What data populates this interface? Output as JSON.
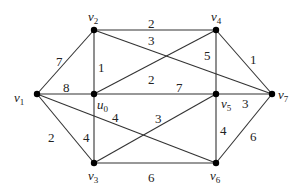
{
  "graph": {
    "type": "weighted-undirected",
    "nodes": [
      {
        "id": "v1",
        "label": "v",
        "sub": "1",
        "x": 37,
        "y": 94,
        "lx": 14,
        "ly": 102
      },
      {
        "id": "v2",
        "label": "v",
        "sub": "2",
        "x": 94,
        "y": 30,
        "lx": 88,
        "ly": 21
      },
      {
        "id": "u0",
        "label": "u",
        "sub": "0",
        "x": 94,
        "y": 94,
        "lx": 97,
        "ly": 109
      },
      {
        "id": "v4",
        "label": "v",
        "sub": "4",
        "x": 216,
        "y": 30,
        "lx": 211,
        "ly": 21
      },
      {
        "id": "v5",
        "label": "v",
        "sub": "5",
        "x": 216,
        "y": 94,
        "lx": 221,
        "ly": 108
      },
      {
        "id": "v7",
        "label": "v",
        "sub": "7",
        "x": 272,
        "y": 94,
        "lx": 278,
        "ly": 99
      },
      {
        "id": "v3",
        "label": "v",
        "sub": "3",
        "x": 94,
        "y": 163,
        "lx": 88,
        "ly": 180
      },
      {
        "id": "v6",
        "label": "v",
        "sub": "6",
        "x": 216,
        "y": 163,
        "lx": 210,
        "ly": 180
      }
    ],
    "edges": [
      {
        "from": "v1",
        "to": "v2",
        "weight": "7",
        "lx": 56,
        "ly": 66
      },
      {
        "from": "v1",
        "to": "u0",
        "weight": "8",
        "lx": 63,
        "ly": 92
      },
      {
        "from": "v1",
        "to": "v3",
        "weight": "2",
        "lx": 48,
        "ly": 142
      },
      {
        "from": "v1",
        "to": "v6",
        "weight": "4",
        "lx": 112,
        "ly": 122
      },
      {
        "from": "v2",
        "to": "v4",
        "weight": "2",
        "lx": 148,
        "ly": 28
      },
      {
        "from": "v2",
        "to": "v7",
        "weight": "3",
        "lx": 148,
        "ly": 45
      },
      {
        "from": "v2",
        "to": "u0",
        "weight": "1",
        "lx": 98,
        "ly": 72
      },
      {
        "from": "u0",
        "to": "v4",
        "weight": "2",
        "lx": 148,
        "ly": 84
      },
      {
        "from": "u0",
        "to": "v5",
        "weight": "7",
        "lx": 176,
        "ly": 92
      },
      {
        "from": "u0",
        "to": "v3",
        "weight": "4",
        "lx": 83,
        "ly": 142
      },
      {
        "from": "v3",
        "to": "v5",
        "weight": "3",
        "lx": 155,
        "ly": 123
      },
      {
        "from": "v3",
        "to": "v6",
        "weight": "6",
        "lx": 148,
        "ly": 182
      },
      {
        "from": "v4",
        "to": "v5",
        "weight": "5",
        "lx": 204,
        "ly": 60
      },
      {
        "from": "v4",
        "to": "v7",
        "weight": "1",
        "lx": 250,
        "ly": 64
      },
      {
        "from": "v5",
        "to": "v7",
        "weight": "3",
        "lx": 242,
        "ly": 108
      },
      {
        "from": "v5",
        "to": "v6",
        "weight": "4",
        "lx": 220,
        "ly": 135
      },
      {
        "from": "v6",
        "to": "v7",
        "weight": "6",
        "lx": 250,
        "ly": 141
      }
    ]
  }
}
